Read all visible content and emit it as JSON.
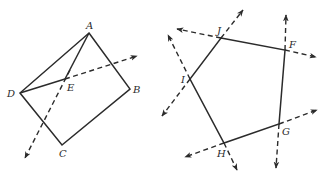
{
  "figures": [
    {
      "name": "quadrilateral-ABCD",
      "polygon": [
        [
          89,
          33
        ],
        [
          130,
          89
        ],
        [
          62,
          145
        ],
        [
          20,
          93
        ]
      ],
      "solid_segments": [
        [
          [
            20,
            93
          ],
          [
            65,
            79
          ]
        ],
        [
          [
            65,
            79
          ],
          [
            89,
            33
          ]
        ]
      ],
      "rays": [
        {
          "from": [
            65,
            79
          ],
          "to": [
            137,
            56
          ]
        },
        {
          "from": [
            70,
            70
          ],
          "to": [
            25,
            158
          ]
        }
      ],
      "labels": [
        {
          "text": "A",
          "x": 86,
          "y": 29
        },
        {
          "text": "B",
          "x": 133,
          "y": 93
        },
        {
          "text": "C",
          "x": 59,
          "y": 157
        },
        {
          "text": "D",
          "x": 7,
          "y": 97
        },
        {
          "text": "E",
          "x": 67,
          "y": 91
        }
      ]
    },
    {
      "name": "pentagon-FGHIJ",
      "polygon": [
        [
          221,
          38
        ],
        [
          285,
          50
        ],
        [
          279,
          124
        ],
        [
          224,
          143
        ],
        [
          190,
          79
        ]
      ],
      "rays": [
        {
          "from": [
            221,
            38
          ],
          "to": [
            177,
            29
          ]
        },
        {
          "from": [
            221,
            38
          ],
          "to": [
            243,
            10
          ]
        },
        {
          "from": [
            285,
            50
          ],
          "to": [
            286,
            15
          ]
        },
        {
          "from": [
            285,
            50
          ],
          "to": [
            316,
            57
          ]
        },
        {
          "from": [
            279,
            124
          ],
          "to": [
            317,
            110
          ]
        },
        {
          "from": [
            279,
            124
          ],
          "to": [
            276,
            168
          ]
        },
        {
          "from": [
            224,
            143
          ],
          "to": [
            185,
            157
          ]
        },
        {
          "from": [
            224,
            143
          ],
          "to": [
            237,
            170
          ]
        },
        {
          "from": [
            190,
            79
          ],
          "to": [
            168,
            35
          ]
        },
        {
          "from": [
            190,
            79
          ],
          "to": [
            162,
            116
          ]
        }
      ],
      "labels": [
        {
          "text": "J",
          "x": 217,
          "y": 34
        },
        {
          "text": "F",
          "x": 289,
          "y": 48
        },
        {
          "text": "G",
          "x": 282,
          "y": 135
        },
        {
          "text": "H",
          "x": 217,
          "y": 157
        },
        {
          "text": "I",
          "x": 181,
          "y": 83
        }
      ]
    }
  ],
  "colors": {
    "ink": "#2b2b2b",
    "background": "#ffffff"
  }
}
